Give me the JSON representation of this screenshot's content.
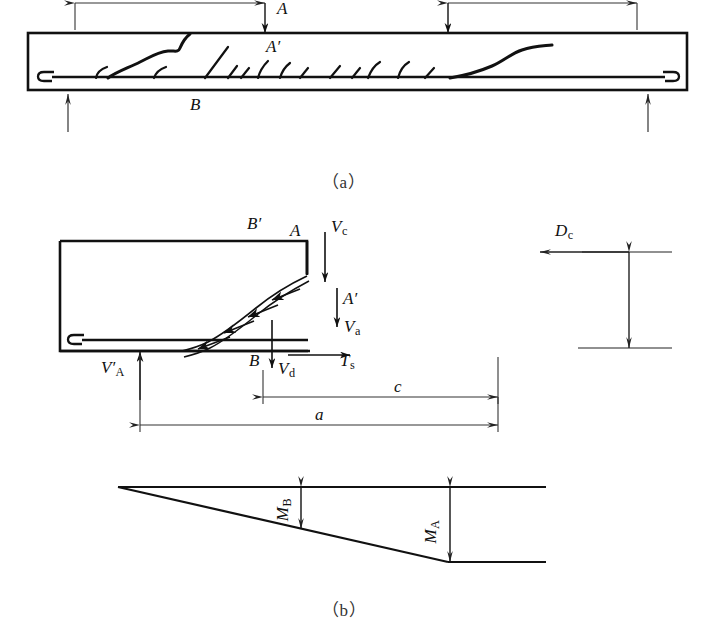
{
  "figure": {
    "title_panels": [
      "（a）",
      "（b）"
    ],
    "captions": {
      "panel_a": "（a）",
      "panel_b": "（b）"
    }
  },
  "panel_a": {
    "name": "cracked-beam-elevation",
    "labels": {
      "point_A": "A",
      "point_A_prime": "A′",
      "point_B": "B"
    },
    "description_items": [
      "simply supported beam with two point loads",
      "flexural and diagonal shear cracks",
      "bottom longitudinal reinforcement with end hooks",
      "support reaction arrows"
    ]
  },
  "panel_b": {
    "name": "free-body-and-moment-diagram",
    "labels": {
      "point_A": "A",
      "point_A_prime": "A′",
      "point_B": "B",
      "point_B_prime": "B′",
      "shear_concrete": {
        "base": "V",
        "sub": "c"
      },
      "shear_aggregate": {
        "base": "V",
        "sub": "a"
      },
      "shear_dowel": {
        "base": "V",
        "sub": "d"
      },
      "steel_tension": {
        "base": "T",
        "sub": "s"
      },
      "reaction_A": {
        "base": "V′",
        "sub": "A"
      },
      "compression_depth": {
        "base": "D",
        "sub": "c"
      },
      "dim_a": "a",
      "dim_c": "c",
      "moment_B": {
        "base": "M",
        "sub": "B"
      },
      "moment_A": {
        "base": "M",
        "sub": "A"
      }
    }
  },
  "colors": {
    "line": "#111111",
    "thin_line": "#444444",
    "background": "#ffffff"
  }
}
